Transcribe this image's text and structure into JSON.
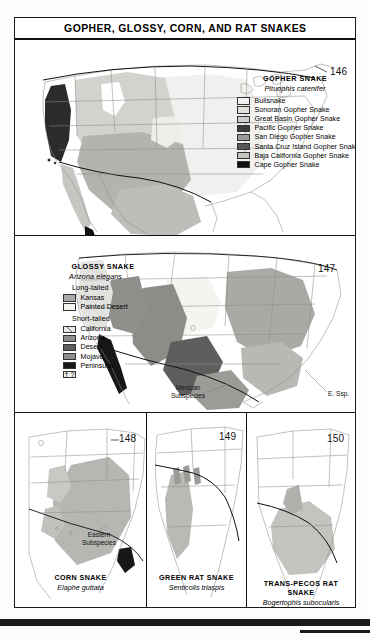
{
  "page": {
    "title": "GOPHER, GLOSSY, CORN, AND RAT SNAKES"
  },
  "panels": [
    {
      "id": "gopher",
      "map_number": "146",
      "legend": {
        "title": "GOPHER SNAKE",
        "scientific_name": "Pituophis catenifer",
        "entries": [
          {
            "label": "Bullsnake",
            "color": "#f2f2f0"
          },
          {
            "label": "Sonoran Gopher Snake",
            "color": "#e0e0dd"
          },
          {
            "label": "Great Basin Gopher Snake",
            "color": "#cfcfcb"
          },
          {
            "label": "Pacific Gopher Snake",
            "color": "#3a3a38"
          },
          {
            "label": "San Diego Gopher Snake",
            "color": "#9a9a96"
          },
          {
            "label": "Santa Cruz Island Gopher Snake",
            "color": "#56565a"
          },
          {
            "label": "Baja California Gopher Snake",
            "color": "#c4c4c0"
          },
          {
            "label": "Cape Gopher Snake",
            "color": "#101010"
          }
        ]
      }
    },
    {
      "id": "glossy",
      "map_number": "147",
      "legend": {
        "title": "GLOSSY SNAKE",
        "scientific_name": "Arizona elegans",
        "groups": [
          {
            "heading": "Long-tailed",
            "entries": [
              {
                "label": "Kansas",
                "color": "#a9a9a5"
              },
              {
                "label": "Painted Desert",
                "color": "#f4f4f1"
              }
            ]
          },
          {
            "heading": "Short-tailed",
            "entries": [
              {
                "label": "California",
                "color": "#e8e8e5",
                "hatched": true
              },
              {
                "label": "Arizona",
                "color": "#8c8c88"
              },
              {
                "label": "Desert",
                "color": "#5e5e5c"
              },
              {
                "label": "Mojave",
                "color": "#8f8f8b"
              },
              {
                "label": "Peninsular",
                "color": "#171717"
              }
            ]
          }
        ],
        "unknown_entry": {
          "symbol": "†",
          "label": "?",
          "color": "#f4f4f1"
        }
      },
      "annotations": [
        {
          "text": "Mexican\nSubspecies",
          "name": "mexican-subspecies-label"
        },
        {
          "text": "E. Ssp.",
          "name": "eastern-subspecies-label"
        }
      ]
    },
    {
      "id": "corn",
      "map_number": "148",
      "caption": {
        "name": "CORN SNAKE",
        "scientific_name": "Elaphe guttata"
      },
      "annotations": [
        {
          "text": "Eastern\nSubspecies",
          "name": "eastern-subspecies-label"
        }
      ]
    },
    {
      "id": "green-rat",
      "map_number": "149",
      "caption": {
        "name": "GREEN RAT SNAKE",
        "scientific_name": "Senticolis triaspis"
      }
    },
    {
      "id": "trans-pecos-rat",
      "map_number": "150",
      "caption": {
        "name": "TRANS-PECOS RAT SNAKE",
        "scientific_name": "Bogertophis subocularis"
      }
    }
  ],
  "colors": {
    "ink": "#111111",
    "paper": "#ffffff",
    "state_line": "#8d8d8a",
    "range_light": "#dedede",
    "range_mid": "#b4b4b1",
    "range_dark": "#8a8a87",
    "range_darker": "#58585a",
    "range_black": "#101010"
  }
}
